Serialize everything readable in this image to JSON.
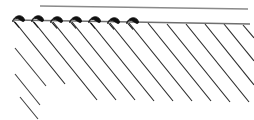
{
  "figure": {
    "type": "technical-line-drawing",
    "width": 254,
    "height": 120,
    "background_color": "#ffffff"
  },
  "chart_data": {
    "type": "line",
    "xlabel": "",
    "ylabel": "",
    "xlim": [
      0,
      254
    ],
    "ylim": [
      0,
      120
    ],
    "grid": false,
    "legend_position": "none",
    "annotations": []
  },
  "top_rule": {
    "name": "upper-horizontal-rule",
    "x1": 40,
    "y1": 6,
    "x2": 248,
    "y2": 9,
    "color": "#8a8a8a",
    "stroke_width": 1.6
  },
  "boundary_line": {
    "name": "section-boundary-line",
    "x1": 14,
    "y1": 20,
    "x2": 250,
    "y2": 24,
    "color": "#6f6f6f",
    "stroke_width": 1.3
  },
  "hooks": {
    "count": 7,
    "color": "#101010",
    "stroke_width": 2.6,
    "positions": [
      {
        "index": 1,
        "x": 16,
        "y": 20
      },
      {
        "index": 2,
        "x": 35,
        "y": 20
      },
      {
        "index": 3,
        "x": 54,
        "y": 21
      },
      {
        "index": 4,
        "x": 73,
        "y": 21
      },
      {
        "index": 5,
        "x": 92,
        "y": 21
      },
      {
        "index": 6,
        "x": 111,
        "y": 22
      },
      {
        "index": 7,
        "x": 130,
        "y": 22
      }
    ]
  },
  "hatching": {
    "name": "diagonal-hatch-fill",
    "color": "#2b2b2b",
    "stroke_width": 1.15,
    "angle_degrees": 52,
    "spacing_px": 19,
    "line_count": 13,
    "lines": [
      {
        "index": 1,
        "x1": 15,
        "y1": 22,
        "x2": 65,
        "y2": 84
      },
      {
        "index": 2,
        "x1": 34,
        "y1": 22,
        "x2": 97,
        "y2": 100
      },
      {
        "index": 3,
        "x1": 53,
        "y1": 22,
        "x2": 116,
        "y2": 100
      },
      {
        "index": 4,
        "x1": 72,
        "y1": 22,
        "x2": 135,
        "y2": 100
      },
      {
        "index": 5,
        "x1": 91,
        "y1": 23,
        "x2": 154,
        "y2": 101
      },
      {
        "index": 6,
        "x1": 110,
        "y1": 23,
        "x2": 173,
        "y2": 101
      },
      {
        "index": 7,
        "x1": 129,
        "y1": 23,
        "x2": 192,
        "y2": 101
      },
      {
        "index": 8,
        "x1": 148,
        "y1": 23,
        "x2": 211,
        "y2": 101
      },
      {
        "index": 9,
        "x1": 167,
        "y1": 24,
        "x2": 230,
        "y2": 102
      },
      {
        "index": 10,
        "x1": 186,
        "y1": 24,
        "x2": 249,
        "y2": 102
      },
      {
        "index": 11,
        "x1": 205,
        "y1": 24,
        "x2": 254,
        "y2": 85
      },
      {
        "index": 12,
        "x1": 224,
        "y1": 24,
        "x2": 254,
        "y2": 61
      },
      {
        "index": 13,
        "x1": 243,
        "y1": 25,
        "x2": 254,
        "y2": 38
      }
    ],
    "short_lines": [
      {
        "index": 1,
        "x1": 15,
        "y1": 48,
        "x2": 46,
        "y2": 86
      },
      {
        "index": 2,
        "x1": 15,
        "y1": 74,
        "x2": 40,
        "y2": 105
      },
      {
        "index": 3,
        "x1": 20,
        "y1": 97,
        "x2": 38,
        "y2": 119
      }
    ]
  }
}
